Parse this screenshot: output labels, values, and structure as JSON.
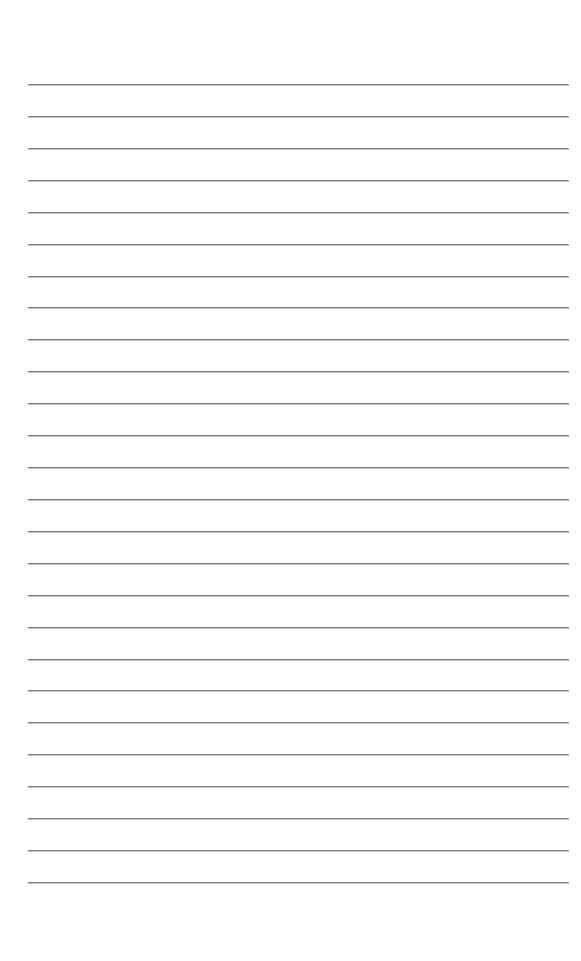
{
  "page": {
    "type": "lined-paper",
    "background_color": "#ffffff",
    "line_color": "#808080",
    "line_count": 26,
    "first_line_y": 84,
    "line_spacing": 31.92,
    "line_left": 28,
    "line_right": 569
  }
}
